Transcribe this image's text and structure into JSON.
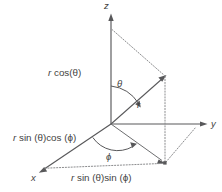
{
  "figure": {
    "type": "spherical-coordinates-diagram",
    "background_color": "#ffffff",
    "line_color": "#58585a",
    "dotted_color": "#8b8c8e",
    "text_color": "#3f3f41"
  },
  "axes": [
    {
      "name": "z",
      "label": "z",
      "direction": "up"
    },
    {
      "name": "y",
      "label": "y",
      "direction": "right"
    },
    {
      "name": "x",
      "label": "x",
      "direction": "down-left"
    }
  ],
  "angles": [
    {
      "name": "theta",
      "label": "θ",
      "between": "z-axis and r vector"
    },
    {
      "name": "phi",
      "label": "ϕ",
      "between": "x-axis and xy-projection"
    }
  ],
  "vectors": [
    {
      "name": "r",
      "label": "r",
      "description": "radial vector from origin to point P"
    }
  ],
  "components": [
    {
      "name": "z-component",
      "prefix": "r",
      "expression": " cos(θ)",
      "full": "r cos(θ)",
      "position": "left of z-axis"
    },
    {
      "name": "x-component",
      "prefix": "r",
      "expression": " sin (θ)cos (ϕ)",
      "full": "r sin (θ)cos (ϕ)",
      "position": "left of origin"
    },
    {
      "name": "y-component",
      "prefix": "r",
      "expression": " sin (θ)sin (ϕ)",
      "full": "r sin (θ)sin (ϕ)",
      "position": "bottom center"
    }
  ]
}
